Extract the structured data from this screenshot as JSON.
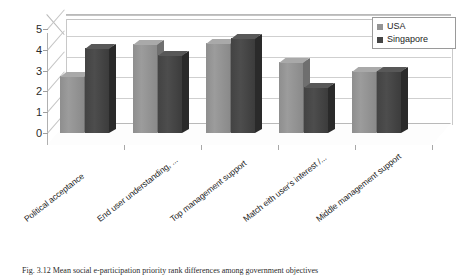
{
  "chart_data": {
    "type": "bar",
    "title": "",
    "subtitle": "",
    "xlabel": "",
    "ylabel": "",
    "ylim": [
      0,
      5
    ],
    "yticks": [
      "0",
      "1",
      "2",
      "3",
      "4",
      "5"
    ],
    "grid": true,
    "three_d": true,
    "legend_position": "top-right",
    "categories": [
      "Political acceptance",
      "End user understanding, ...",
      "Top management support",
      "Match eith user's interest /...",
      "Middle management support"
    ],
    "series": [
      {
        "name": "USA",
        "color": "#949494",
        "values": [
          2.75,
          4.3,
          4.35,
          3.4,
          3.0
        ]
      },
      {
        "name": "Singapore",
        "color": "#454545",
        "values": [
          4.1,
          3.75,
          4.55,
          2.2,
          3.0
        ]
      }
    ]
  },
  "legend": {
    "entries": [
      {
        "label": "USA",
        "swatch_color": "#949494"
      },
      {
        "label": "Singapore",
        "swatch_color": "#454545"
      }
    ]
  },
  "caption": {
    "text": "Fig. 3.12  Mean social e-participation priority rank differences among government objectives"
  }
}
